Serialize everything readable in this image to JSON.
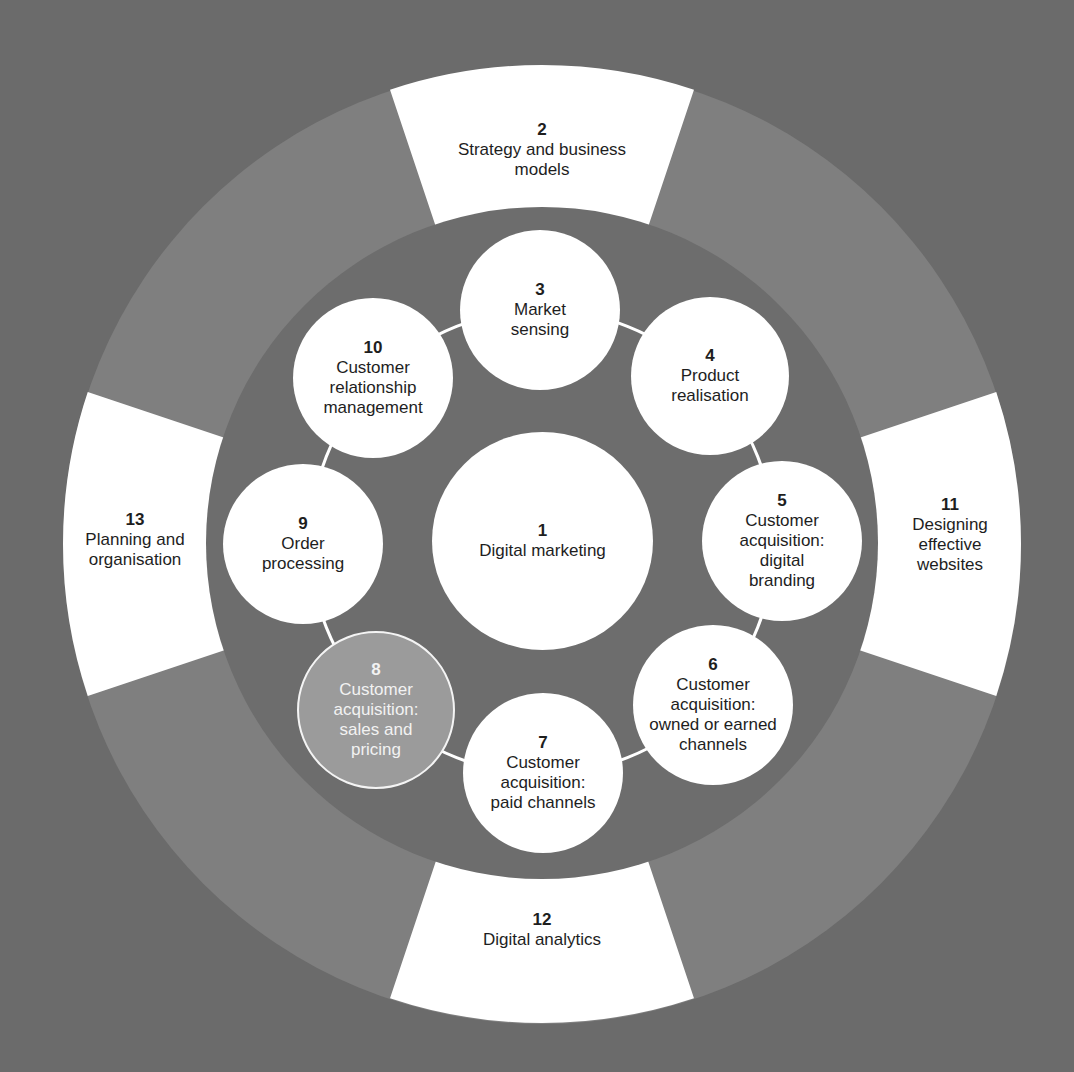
{
  "colors": {
    "background": "#6b6b6b",
    "outer_ring": "#7f7f7f",
    "inner_disc": "#6d6d6d",
    "segment": "#ffffff",
    "node": "#ffffff",
    "highlight_node": "#9b9b9b",
    "connector": "#ffffff",
    "text": "#1e1e1e",
    "highlight_text": "#f2f2f2"
  },
  "center": {
    "number": "1",
    "label": "Digital marketing"
  },
  "outer_segments": [
    {
      "number": "2",
      "label": "Strategy and business\nmodels",
      "position": "top"
    },
    {
      "number": "11",
      "label": "Designing\neffective\nwebsites",
      "position": "right"
    },
    {
      "number": "12",
      "label": "Digital analytics",
      "position": "bottom"
    },
    {
      "number": "13",
      "label": "Planning and\norganisation",
      "position": "left"
    }
  ],
  "ring_nodes": [
    {
      "number": "3",
      "label": "Market\nsensing",
      "highlighted": false
    },
    {
      "number": "4",
      "label": "Product\nrealisation",
      "highlighted": false
    },
    {
      "number": "5",
      "label": "Customer\nacquisition:\ndigital\nbranding",
      "highlighted": false
    },
    {
      "number": "6",
      "label": "Customer\nacquisition:\nowned or earned\nchannels",
      "highlighted": false
    },
    {
      "number": "7",
      "label": "Customer\nacquisition:\npaid channels",
      "highlighted": false
    },
    {
      "number": "8",
      "label": "Customer\nacquisition:\nsales and\npricing",
      "highlighted": true
    },
    {
      "number": "9",
      "label": "Order\nprocessing",
      "highlighted": false
    },
    {
      "number": "10",
      "label": "Customer\nrelationship\nmanagement",
      "highlighted": false
    }
  ]
}
